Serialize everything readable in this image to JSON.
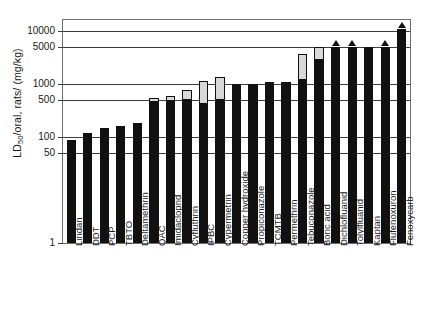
{
  "chart_data": {
    "type": "bar",
    "title": "",
    "subtitle": "",
    "xlabel": "",
    "ylabel": "LD50/oral, rats/ (mg/kg)",
    "ylabel_parts": {
      "prefix": "LD",
      "subscript": "50",
      "suffix": "/oral, rats/ (mg/kg)"
    },
    "yscale": "log",
    "ylim": [
      1,
      16000
    ],
    "grid": true,
    "legend": "none",
    "ytick_labels": [
      "10000",
      "5000",
      "1000",
      "500",
      "100",
      "50",
      "1"
    ],
    "ytick_values": [
      10000,
      5000,
      1000,
      500,
      100,
      50,
      1
    ],
    "categories": [
      "Lindan",
      "DDT",
      "PCP",
      "TBTO",
      "Deltamethrin",
      "QAC",
      "Imidacloprid",
      "Cyfluthrin",
      "IPBC",
      "Cypermetrin",
      "Copper hydroxide",
      "Propiconazole",
      "TCMTB",
      "Permethrin",
      "Tebuconazole",
      "Boric acid",
      "Dichlofluanid",
      "Tolylfluanid",
      "Kaptan",
      "Flufenoxuron",
      "Fenoxycarb"
    ],
    "series": [
      {
        "name": "LD50 lower value",
        "values": [
          88,
          120,
          145,
          160,
          185,
          450,
          475,
          500,
          425,
          500,
          1000,
          1000,
          1100,
          1100,
          1200,
          2800,
          5000,
          5000,
          5000,
          5000,
          11000
        ]
      },
      {
        "name": "LD50 upper value",
        "values": [
          88,
          120,
          145,
          160,
          185,
          530,
          580,
          750,
          1150,
          1350,
          1000,
          1000,
          1100,
          1100,
          3600,
          5000,
          5000,
          5000,
          5000,
          5000,
          11000
        ]
      }
    ],
    "range_bars": [
      false,
      false,
      false,
      false,
      false,
      true,
      true,
      true,
      true,
      true,
      false,
      false,
      false,
      false,
      true,
      true,
      false,
      false,
      false,
      false,
      false
    ],
    "greater_than_markers": [
      false,
      false,
      false,
      false,
      false,
      false,
      false,
      false,
      false,
      false,
      false,
      false,
      false,
      false,
      false,
      false,
      true,
      true,
      false,
      true,
      true
    ]
  }
}
